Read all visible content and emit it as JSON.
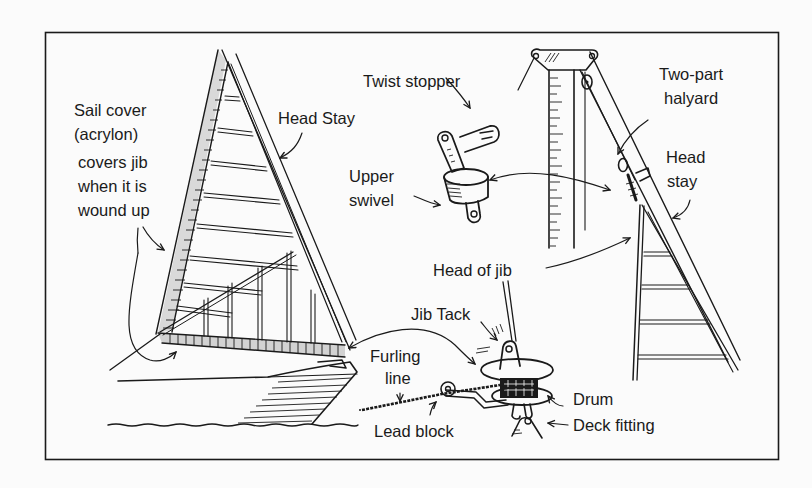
{
  "diagram": {
    "type": "illustration",
    "colors": {
      "ink": "#1a1a1a",
      "paper": "#fbfbfb"
    },
    "labels": {
      "sail_cover": [
        "Sail cover",
        "(acrylon)"
      ],
      "covers_jib": [
        "covers jib",
        "when it is",
        "wound up"
      ],
      "head_stay_left": "Head Stay",
      "twist_stopper": "Twist stopper",
      "upper_swivel": [
        "Upper",
        "swivel"
      ],
      "two_part_halyard": [
        "Two-part",
        "halyard"
      ],
      "head_stay_right": [
        "Head",
        "stay"
      ],
      "head_of_jib": "Head of jib",
      "jib_tack": "Jib Tack",
      "furling_line": [
        "Furling",
        "line"
      ],
      "drum": "Drum",
      "lead_block": "Lead block",
      "deck_fitting": "Deck fitting"
    }
  }
}
